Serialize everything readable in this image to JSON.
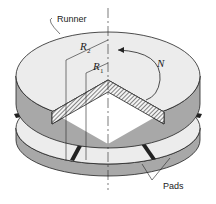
{
  "diagram": {
    "labels": {
      "runner": "Runner",
      "pads": "Pads",
      "outer_radius": "R",
      "outer_radius_sub": "2",
      "inner_radius": "R",
      "inner_radius_sub": "1",
      "speed": "N"
    },
    "colors": {
      "surface": "#ececec",
      "side": "#a8a8a8",
      "outline": "#222222",
      "hatch": "#333333",
      "pad_gap": "#222222"
    }
  }
}
